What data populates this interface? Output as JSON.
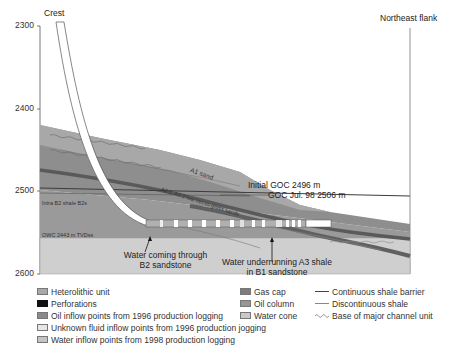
{
  "diagram": {
    "left_label": "Crest",
    "right_label": "Northeast flank",
    "y_axis": {
      "ticks": [
        "2300",
        "2400",
        "2500",
        "2600"
      ]
    },
    "annotations": {
      "a1_sand": "A1 sand",
      "a2_sands": "A2.1, A2.2 low net-to-gross sands",
      "initial_goc": "Initial GOC  2496 m",
      "goc_jul98": "GOC Jul. 98  2506 m",
      "intra_b2": "Intra B2 shale B2s",
      "owc": "OWC 2443 m TVDss",
      "water_b2_line1": "Water coming through",
      "water_b2_line2": "B2 sandstone",
      "water_a3_line1": "Water underrunning A3 shale",
      "water_a3_line2": "in B1 sandstone"
    },
    "colors": {
      "gas_cap": "#8c8c8c",
      "oil_column": "#a6a6a6",
      "heterolithic": "#b4b4b4",
      "water_cone": "#c8c8c8",
      "water_zone": "#cfcfcf",
      "shale": "#6e6e6e",
      "perforation": "#111111"
    }
  },
  "legend": {
    "col1": [
      {
        "label": "Heterolithic unit",
        "swatch": "#a9a9a9"
      },
      {
        "label": "Perforations",
        "swatch": "#111111"
      },
      {
        "label": "Oil inflow points from 1996 production logging",
        "swatch": "#8a8a8a"
      },
      {
        "label": "Unknown fluid inflow points from 1996 production jogging",
        "swatch": "#e6e6e6"
      },
      {
        "label": "Water inflow points from 1998 production logging",
        "swatch": "#c4c4c4"
      }
    ],
    "col2": [
      {
        "label": "Gas cap",
        "swatch": "#7d7d7d"
      },
      {
        "label": "Oil column",
        "swatch": "#969696"
      },
      {
        "label": "Water cone",
        "swatch": "#c9c9c9"
      }
    ],
    "col3": [
      {
        "label": "Continuous shale barrier",
        "style": "solid"
      },
      {
        "label": "Discontinuous shale",
        "style": "thin"
      },
      {
        "label": "Base of major channel unit",
        "style": "wavy"
      }
    ]
  }
}
